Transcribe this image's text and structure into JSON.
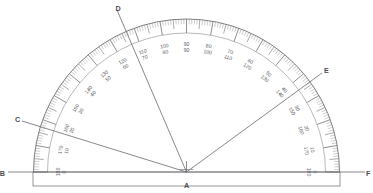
{
  "figure": {
    "kind": "protractor-diagram",
    "background_color": "#ffffff",
    "ink_color": "#6a6a70",
    "label_color": "#4a4a50"
  },
  "geometry": {
    "center_x": 186.5,
    "center_y": 172.0,
    "outer_radius": 153.0,
    "inner_radius": 139.0,
    "baseline_y": 172.0,
    "baseline_x1": 8.0,
    "baseline_x2": 365.0,
    "base_rect": {
      "x": 33.0,
      "y": 172.0,
      "width": 307.0,
      "height": 14.0
    }
  },
  "points": [
    {
      "name": "A",
      "label": "A",
      "role": "vertex",
      "x": 186.5,
      "y": 172.0,
      "label_x": 186.5,
      "label_y": 186.0
    },
    {
      "name": "B",
      "label": "B",
      "role": "baseline-end-left",
      "x": 8.0,
      "y": 172.0,
      "label_x": 5.0,
      "label_y": 174.5
    },
    {
      "name": "F",
      "label": "F",
      "role": "baseline-end-right",
      "x": 365.0,
      "y": 172.0,
      "label_x": 366.0,
      "label_y": 174.5
    },
    {
      "name": "C",
      "label": "C",
      "role": "ray-end",
      "x": 22.0,
      "y": 121.0,
      "label_x": 17.5,
      "label_y": 120.0
    },
    {
      "name": "D",
      "label": "D",
      "role": "ray-end",
      "x": 117.0,
      "y": 10.0,
      "label_x": 118.0,
      "label_y": 9.0
    },
    {
      "name": "E",
      "label": "E",
      "role": "ray-end",
      "x": 322.0,
      "y": 73.0,
      "label_x": 326.5,
      "label_y": 71.0
    }
  ],
  "rays": [
    {
      "name": "ray-AC",
      "from": "A",
      "to": "C",
      "angle_deg": 164
    },
    {
      "name": "ray-AD",
      "from": "A",
      "to": "D",
      "angle_deg": 113
    },
    {
      "name": "ray-AE",
      "from": "A",
      "to": "E",
      "angle_deg": 36
    },
    {
      "name": "ray-AB",
      "from": "A",
      "to": "B",
      "angle_deg": 180
    },
    {
      "name": "ray-AF",
      "from": "A",
      "to": "F",
      "angle_deg": 0
    }
  ],
  "scale": {
    "description": "Double scale: outer numbers increase counter-clockwise from right (0-180), inner numbers increase clockwise from left (0-180)",
    "tick_step_deg": 1,
    "major_tick_step_deg": 10,
    "mid_tick_step_deg": 5,
    "labels": [
      {
        "angle_deg": 0,
        "outer": "0",
        "inner": "180"
      },
      {
        "angle_deg": 10,
        "outer": "10",
        "inner": "170"
      },
      {
        "angle_deg": 20,
        "outer": "20",
        "inner": "160"
      },
      {
        "angle_deg": 30,
        "outer": "30",
        "inner": "150"
      },
      {
        "angle_deg": 40,
        "outer": "40",
        "inner": "140"
      },
      {
        "angle_deg": 50,
        "outer": "50",
        "inner": "130"
      },
      {
        "angle_deg": 60,
        "outer": "60",
        "inner": "120"
      },
      {
        "angle_deg": 70,
        "outer": "70",
        "inner": "110"
      },
      {
        "angle_deg": 80,
        "outer": "80",
        "inner": "100"
      },
      {
        "angle_deg": 90,
        "outer": "90",
        "inner": "90"
      },
      {
        "angle_deg": 100,
        "outer": "100",
        "inner": "80"
      },
      {
        "angle_deg": 110,
        "outer": "110",
        "inner": "70"
      },
      {
        "angle_deg": 120,
        "outer": "120",
        "inner": "60"
      },
      {
        "angle_deg": 130,
        "outer": "130",
        "inner": "50"
      },
      {
        "angle_deg": 140,
        "outer": "140",
        "inner": "40"
      },
      {
        "angle_deg": 150,
        "outer": "150",
        "inner": "30"
      },
      {
        "angle_deg": 160,
        "outer": "160",
        "inner": "20"
      },
      {
        "angle_deg": 170,
        "outer": "170",
        "inner": "10"
      },
      {
        "angle_deg": 180,
        "outer": "180",
        "inner": "0"
      }
    ]
  }
}
